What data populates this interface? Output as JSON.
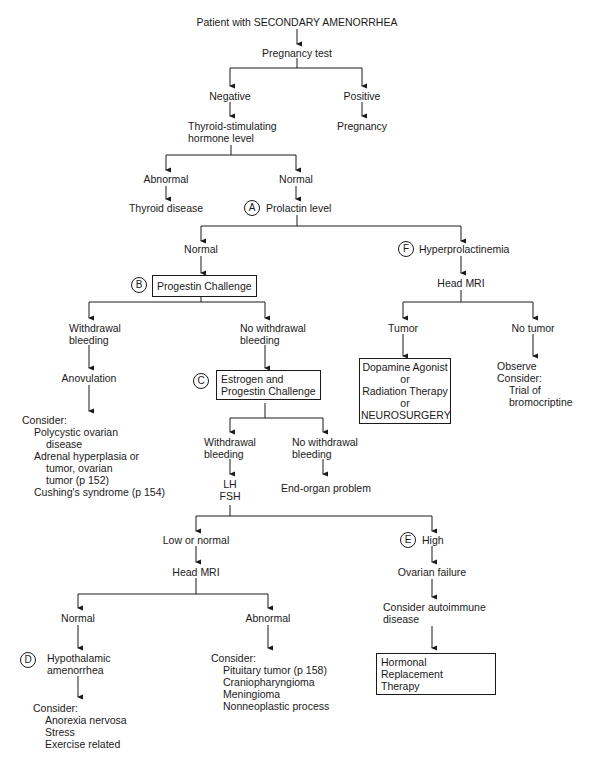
{
  "title": "Patient with SECONDARY AMENORRHEA",
  "nodes": {
    "pregnancy_test": "Pregnancy test",
    "negative": "Negative",
    "positive": "Positive",
    "pregnancy": "Pregnancy",
    "tsh_line1": "Thyroid-stimulating",
    "tsh_line2": "hormone level",
    "tsh_abnormal": "Abnormal",
    "thyroid_disease": "Thyroid disease",
    "tsh_normal": "Normal",
    "prolactin_level": "Prolactin level",
    "prolactin_normal": "Normal",
    "hyperprolactinemia": "Hyperprolactinemia",
    "head_mri_top": "Head MRI",
    "tumor": "Tumor",
    "no_tumor": "No tumor",
    "tumor_treatment": [
      "Dopamine Agonist",
      "or",
      "Radiation Therapy",
      "or",
      "NEUROSURGERY"
    ],
    "no_tumor_plan": [
      "Observe",
      "Consider:",
      "Trial of",
      "bromocriptine"
    ],
    "progestin_challenge": "Progestin Challenge",
    "withdrawal_bleeding": [
      "Withdrawal",
      "bleeding"
    ],
    "no_withdrawal_bleeding": [
      "No withdrawal",
      "bleeding"
    ],
    "anovulation": "Anovulation",
    "anovulation_consider": {
      "heading": "Consider:",
      "items": [
        [
          "Polycystic ovarian",
          "disease"
        ],
        [
          "Adrenal hyperplasia or",
          "tumor, ovarian",
          "tumor (p 152)"
        ],
        [
          "Cushing's syndrome (p 154)"
        ]
      ]
    },
    "estrogen_progestin_challenge": [
      "Estrogen and",
      "Progestin Challenge"
    ],
    "ep_withdrawal_bleeding": [
      "Withdrawal",
      "bleeding"
    ],
    "ep_no_withdrawal_bleeding": [
      "No withdrawal",
      "bleeding"
    ],
    "lh_fsh": [
      "LH",
      "FSH"
    ],
    "end_organ_problem": "End-organ problem",
    "low_or_normal": "Low or normal",
    "high": "High",
    "head_mri_bottom": "Head MRI",
    "ovarian_failure": "Ovarian failure",
    "consider_autoimmune": [
      "Consider autoimmune",
      "disease"
    ],
    "hormonal_replacement": [
      "Hormonal Replacement",
      "Therapy"
    ],
    "mri_normal": "Normal",
    "mri_abnormal": "Abnormal",
    "hypothalamic_amenorrhea": [
      "Hypothalamic",
      "amenorrhea"
    ],
    "hypothalamic_consider": {
      "heading": "Consider:",
      "items": [
        "Anorexia nervosa",
        "Stress",
        "Exercise related"
      ]
    },
    "abnormal_consider": {
      "heading": "Consider:",
      "items": [
        "Pituitary tumor (p 158)",
        "Craniopharyngioma",
        "Meningioma",
        "Nonneoplastic process"
      ]
    }
  },
  "markers": {
    "A": "A",
    "B": "B",
    "C": "C",
    "D": "D",
    "E": "E",
    "F": "F"
  },
  "colors": {
    "line": "#1a1a1a",
    "background": "#ffffff"
  }
}
